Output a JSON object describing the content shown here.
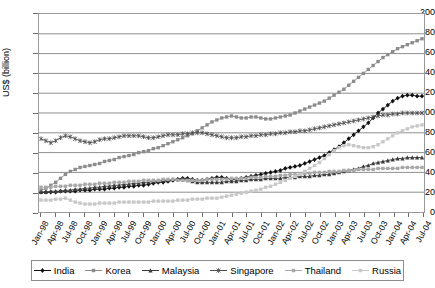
{
  "axes": {
    "y_title": "US$ (billion)",
    "y_ticks": [
      "200",
      "180",
      "160",
      "140",
      "120",
      "100",
      "80",
      "60",
      "40",
      "20",
      "0"
    ],
    "x_labels": [
      "Jan-98",
      "Apr-98",
      "Jul-98",
      "Oct-98",
      "Jan-99",
      "Apr-99",
      "Jul-99",
      "Oct-99",
      "Jan-00",
      "Apr-00",
      "Jul-00",
      "Oct-00",
      "Jan-01",
      "Apr-01",
      "Jul-01",
      "Oct-01",
      "Jan-02",
      "Apr-02",
      "Jul-02",
      "Oct-02",
      "Jan-03",
      "Apr-03",
      "Jul-03",
      "Oct-03",
      "Jan-04",
      "Apr-04",
      "Jul-04"
    ]
  },
  "legend": {
    "items": [
      {
        "label": "India",
        "marker": "diamond",
        "color": "#101010"
      },
      {
        "label": "Korea",
        "marker": "square",
        "color": "#8c8c8c"
      },
      {
        "label": "Malaysia",
        "marker": "triangle",
        "color": "#3c3c3c"
      },
      {
        "label": "Singapore",
        "marker": "star",
        "color": "#4d4d4d"
      },
      {
        "label": "Thailand",
        "marker": "square",
        "color": "#a8a8a8"
      },
      {
        "label": "Russia",
        "marker": "square",
        "color": "#c8c8c8"
      }
    ]
  },
  "chart_data": {
    "type": "line",
    "title": "",
    "xlabel": "",
    "ylabel": "US$ (billion)",
    "ylim": [
      0,
      200
    ],
    "ytick_step": 20,
    "grid": true,
    "legend_position": "bottom",
    "x_tick_labels": [
      "Jan-98",
      "Apr-98",
      "Jul-98",
      "Oct-98",
      "Jan-99",
      "Apr-99",
      "Jul-99",
      "Oct-99",
      "Jan-00",
      "Apr-00",
      "Jul-00",
      "Oct-00",
      "Jan-01",
      "Apr-01",
      "Jul-01",
      "Oct-01",
      "Jan-02",
      "Apr-02",
      "Jul-02",
      "Oct-02",
      "Jan-03",
      "Apr-03",
      "Jul-03",
      "Oct-03",
      "Jan-04",
      "Apr-04",
      "Jul-04"
    ],
    "x_label_interval_months": 3,
    "x_start": "Jan-98",
    "x_end": "Jul-04",
    "n_points": 79,
    "series": [
      {
        "name": "India",
        "marker": "diamond",
        "color": "#101010",
        "values": [
          20,
          20,
          20,
          20,
          21,
          21,
          21,
          21,
          22,
          22,
          22,
          23,
          23,
          23,
          24,
          24,
          25,
          25,
          26,
          26,
          27,
          27,
          28,
          29,
          30,
          30,
          31,
          32,
          33,
          34,
          34,
          33,
          32,
          32,
          33,
          34,
          35,
          35,
          34,
          33,
          33,
          34,
          35,
          36,
          37,
          38,
          39,
          40,
          41,
          42,
          44,
          45,
          46,
          47,
          49,
          51,
          53,
          55,
          57,
          60,
          63,
          66,
          70,
          74,
          78,
          82,
          86,
          90,
          95,
          100,
          104,
          108,
          112,
          115,
          117,
          118,
          118,
          117,
          117
        ]
      },
      {
        "name": "Korea",
        "marker": "square",
        "color": "#8c8c8c",
        "values": [
          22,
          24,
          27,
          30,
          34,
          38,
          41,
          43,
          45,
          46,
          47,
          48,
          49,
          51,
          52,
          53,
          55,
          56,
          57,
          58,
          60,
          61,
          62,
          64,
          65,
          67,
          69,
          71,
          73,
          75,
          77,
          79,
          82,
          85,
          88,
          91,
          93,
          95,
          96,
          97,
          96,
          95,
          95,
          96,
          96,
          95,
          94,
          94,
          95,
          96,
          97,
          98,
          100,
          102,
          104,
          106,
          108,
          110,
          112,
          115,
          118,
          121,
          124,
          128,
          132,
          136,
          140,
          144,
          148,
          152,
          156,
          159,
          162,
          165,
          167,
          169,
          171,
          173,
          175
        ]
      },
      {
        "name": "Malaysia",
        "marker": "triangle",
        "color": "#3c3c3c",
        "values": [
          20,
          20,
          21,
          21,
          21,
          22,
          22,
          23,
          23,
          24,
          24,
          25,
          25,
          26,
          26,
          27,
          27,
          28,
          28,
          29,
          29,
          30,
          30,
          31,
          31,
          32,
          32,
          33,
          33,
          33,
          32,
          31,
          30,
          30,
          30,
          30,
          30,
          30,
          31,
          31,
          31,
          32,
          32,
          33,
          33,
          33,
          34,
          34,
          34,
          34,
          35,
          35,
          35,
          36,
          36,
          36,
          37,
          37,
          38,
          38,
          39,
          40,
          41,
          42,
          43,
          44,
          46,
          47,
          49,
          50,
          51,
          52,
          53,
          54,
          54,
          55,
          55,
          55,
          55
        ]
      },
      {
        "name": "Singapore",
        "marker": "star",
        "color": "#4d4d4d",
        "values": [
          74,
          72,
          70,
          72,
          75,
          77,
          76,
          74,
          72,
          71,
          70,
          71,
          73,
          74,
          74,
          75,
          76,
          77,
          77,
          77,
          77,
          76,
          75,
          75,
          76,
          77,
          78,
          78,
          78,
          79,
          79,
          80,
          80,
          80,
          79,
          78,
          77,
          76,
          75,
          75,
          75,
          76,
          76,
          77,
          77,
          78,
          78,
          79,
          79,
          80,
          80,
          81,
          81,
          82,
          82,
          83,
          84,
          85,
          86,
          87,
          88,
          89,
          90,
          91,
          92,
          93,
          94,
          95,
          96,
          97,
          98,
          98,
          99,
          99,
          100,
          100,
          100,
          100,
          100
        ]
      },
      {
        "name": "Thailand",
        "marker": "square",
        "color": "#a8a8a8",
        "values": [
          25,
          25,
          25,
          26,
          26,
          26,
          27,
          27,
          27,
          28,
          28,
          28,
          29,
          29,
          29,
          30,
          30,
          30,
          31,
          31,
          31,
          32,
          32,
          32,
          32,
          33,
          33,
          33,
          32,
          32,
          32,
          32,
          32,
          32,
          33,
          33,
          33,
          33,
          33,
          34,
          34,
          34,
          34,
          35,
          35,
          35,
          36,
          36,
          36,
          37,
          37,
          38,
          38,
          38,
          39,
          39,
          40,
          40,
          40,
          41,
          41,
          41,
          42,
          42,
          42,
          43,
          43,
          43,
          43,
          44,
          44,
          44,
          44,
          44,
          45,
          45,
          45,
          45,
          45
        ]
      },
      {
        "name": "Russia",
        "marker": "square",
        "color": "#c8c8c8",
        "values": [
          12,
          12,
          12,
          13,
          13,
          14,
          12,
          10,
          9,
          8,
          8,
          8,
          9,
          9,
          9,
          9,
          10,
          10,
          10,
          10,
          10,
          10,
          10,
          11,
          11,
          11,
          11,
          11,
          12,
          12,
          12,
          13,
          13,
          13,
          14,
          14,
          14,
          15,
          16,
          17,
          18,
          19,
          20,
          21,
          22,
          23,
          25,
          26,
          28,
          30,
          32,
          34,
          36,
          38,
          41,
          44,
          47,
          50,
          54,
          58,
          62,
          65,
          67,
          68,
          67,
          66,
          65,
          65,
          66,
          68,
          71,
          74,
          77,
          80,
          82,
          84,
          86,
          87,
          88
        ]
      }
    ]
  }
}
